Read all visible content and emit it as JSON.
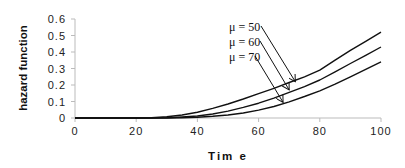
{
  "chart_data": {
    "type": "line",
    "title": "",
    "xlabel": "Tim e",
    "ylabel": "hazard function",
    "xlim": [
      0,
      100
    ],
    "ylim": [
      0,
      0.6
    ],
    "x_ticks": [
      "0",
      "20",
      "40",
      "60",
      "80",
      "100"
    ],
    "y_ticks": [
      "0",
      "0.1",
      "0.2",
      "0.3",
      "0.4",
      "0.5",
      "0.6"
    ],
    "grid": false,
    "legend": "annotations with arrows",
    "x": [
      0,
      10,
      20,
      25,
      30,
      35,
      40,
      45,
      50,
      55,
      60,
      65,
      70,
      75,
      80,
      85,
      90,
      95,
      100
    ],
    "series": [
      {
        "name": "μ = 50",
        "values": [
          0,
          0,
          0,
          0.002,
          0.008,
          0.018,
          0.035,
          0.058,
          0.085,
          0.115,
          0.148,
          0.18,
          0.215,
          0.25,
          0.29,
          0.35,
          0.41,
          0.465,
          0.52
        ]
      },
      {
        "name": "μ = 60",
        "values": [
          0,
          0,
          0,
          0,
          0.002,
          0.006,
          0.012,
          0.024,
          0.042,
          0.064,
          0.09,
          0.12,
          0.155,
          0.19,
          0.23,
          0.28,
          0.33,
          0.38,
          0.43
        ]
      },
      {
        "name": "μ = 70",
        "values": [
          0,
          0,
          0,
          0,
          0,
          0.002,
          0.005,
          0.01,
          0.018,
          0.03,
          0.048,
          0.07,
          0.098,
          0.13,
          0.165,
          0.205,
          0.25,
          0.295,
          0.34
        ]
      }
    ],
    "annotations": [
      {
        "text": "μ = 50",
        "arrow_to": [
          72,
          0.22
        ]
      },
      {
        "text": "μ = 60",
        "arrow_to": [
          70,
          0.17
        ]
      },
      {
        "text": "μ = 70",
        "arrow_to": [
          68,
          0.095
        ]
      }
    ]
  }
}
